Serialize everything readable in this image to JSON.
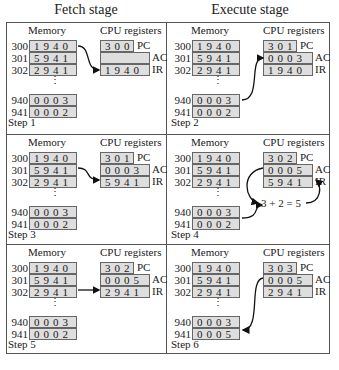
{
  "headers": {
    "fetch": "Fetch stage",
    "execute": "Execute stage"
  },
  "labels": {
    "memory": "Memory",
    "cpu": "CPU registers",
    "pc": "PC",
    "ac": "AC",
    "ir": "IR",
    "ellipsis": "⋮"
  },
  "steps": [
    {
      "label": "Step 1",
      "memory": [
        {
          "addr": "300",
          "val": "1940"
        },
        {
          "addr": "301",
          "val": "5941"
        },
        {
          "addr": "302",
          "val": "2941"
        },
        {
          "addr": "940",
          "val": "0003"
        },
        {
          "addr": "941",
          "val": "0002"
        }
      ],
      "pc": "300",
      "ac": "",
      "ir": "1940"
    },
    {
      "label": "Step 2",
      "memory": [
        {
          "addr": "300",
          "val": "1940"
        },
        {
          "addr": "301",
          "val": "5941"
        },
        {
          "addr": "302",
          "val": "2941"
        },
        {
          "addr": "940",
          "val": "0003"
        },
        {
          "addr": "941",
          "val": "0002"
        }
      ],
      "pc": "301",
      "ac": "0003",
      "ir": "1940"
    },
    {
      "label": "Step 3",
      "memory": [
        {
          "addr": "300",
          "val": "1940"
        },
        {
          "addr": "301",
          "val": "5941"
        },
        {
          "addr": "302",
          "val": "2941"
        },
        {
          "addr": "940",
          "val": "0003"
        },
        {
          "addr": "941",
          "val": "0002"
        }
      ],
      "pc": "301",
      "ac": "0003",
      "ir": "5941"
    },
    {
      "label": "Step 4",
      "memory": [
        {
          "addr": "300",
          "val": "1940"
        },
        {
          "addr": "301",
          "val": "5941"
        },
        {
          "addr": "302",
          "val": "2941"
        },
        {
          "addr": "940",
          "val": "0003"
        },
        {
          "addr": "941",
          "val": "0002"
        }
      ],
      "pc": "302",
      "ac": "0005",
      "ir": "5941",
      "calc": "3 + 2 = 5"
    },
    {
      "label": "Step 5",
      "memory": [
        {
          "addr": "300",
          "val": "1940"
        },
        {
          "addr": "301",
          "val": "5941"
        },
        {
          "addr": "302",
          "val": "2941"
        },
        {
          "addr": "940",
          "val": "0003"
        },
        {
          "addr": "941",
          "val": "0002"
        }
      ],
      "pc": "302",
      "ac": "0005",
      "ir": "2941"
    },
    {
      "label": "Step 6",
      "memory": [
        {
          "addr": "300",
          "val": "1940"
        },
        {
          "addr": "301",
          "val": "5941"
        },
        {
          "addr": "302",
          "val": "2941"
        },
        {
          "addr": "940",
          "val": "0003"
        },
        {
          "addr": "941",
          "val": "0005"
        }
      ],
      "pc": "303",
      "ac": "0005",
      "ir": "2941"
    }
  ]
}
